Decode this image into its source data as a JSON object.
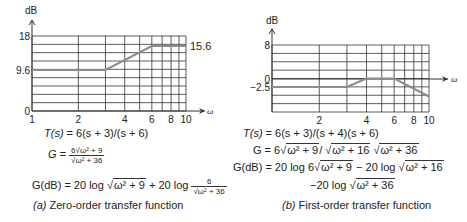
{
  "chart_data": [
    {
      "type": "line",
      "id": "a",
      "title": "(a) Zero-order transfer function",
      "xlabel": "ω",
      "ylabel": "dB",
      "xscale": "log",
      "xlim": [
        1,
        10
      ],
      "ylim": [
        0,
        18
      ],
      "xticks": [
        1,
        2,
        4,
        6,
        8,
        10
      ],
      "yticks": [
        0,
        9.6,
        18
      ],
      "grid": true,
      "x": [
        1,
        3,
        6,
        10
      ],
      "values": [
        9.6,
        9.6,
        15.6,
        15.6
      ],
      "annotations": [
        {
          "text": "15.6",
          "x": 10,
          "y": 15.6
        }
      ]
    },
    {
      "type": "line",
      "id": "b",
      "title": "(b) First-order transfer function",
      "xlabel": "ω",
      "ylabel": "dB",
      "xscale": "log",
      "xlim": [
        1,
        10
      ],
      "ylim": [
        -8,
        8
      ],
      "xticks": [
        2,
        4,
        6,
        8,
        10
      ],
      "yticks": [
        8,
        0,
        -2.5
      ],
      "grid": true,
      "x": [
        1,
        3,
        4,
        6,
        10
      ],
      "values": [
        -2.5,
        -2.5,
        0,
        0,
        -4.3
      ]
    }
  ],
  "panel_a": {
    "eq1": "T(s) = 6(s + 3)/(s + 6)",
    "eq2": "G = 6√(ω² + 9) / √(ω² + 36)",
    "eq3": "G(dB) = 20 log √(ω² + 9) + 20 log 6/√(ω² + 36)",
    "caption_tag": "(a)",
    "caption_text": "Zero-order transfer function",
    "parts": {
      "t_lhs": "T(s)",
      "t_rhs": " = 6(s + 3)/(s + 6)",
      "g_lhs": "G = ",
      "g_num": "6√ω² + 9",
      "g_den": "√ω² + 36",
      "gdb_a": "G(dB) = 20 log ",
      "gdb_s1": "ω² + 9",
      "gdb_b": " + 20 log ",
      "gdb_num": "6",
      "gdb_den": "√ω² + 36"
    }
  },
  "panel_b": {
    "eq1": "T(s) = 6(s + 3)/(s + 4)(s + 6)",
    "eq2": "G = 6√(ω² + 9) / √(ω² + 16) √(ω² + 36)",
    "eq3": "G(dB) = 20 log 6√(ω² + 9) − 20 log √(ω² + 16)",
    "eq4": "−20 log √(ω² + 36)",
    "caption_tag": "(b)",
    "caption_text": "First-order transfer function",
    "parts": {
      "t_lhs": "T(s)",
      "t_rhs": " = 6(s + 3)/(s + 4)(s + 6)",
      "g_a": "G = 6",
      "g_s1": "ω² + 9",
      "g_b": "/ ",
      "g_s2": "ω² + 16",
      "g_s3": "ω² + 36",
      "gdb_a": "G(dB) = 20 log 6",
      "gdb_s1": "ω² + 9",
      "gdb_b": " − 20 log ",
      "gdb_s2": "ω² + 16",
      "l4_a": "−20 log ",
      "l4_s": "ω² + 36"
    }
  },
  "colors": {
    "grid": "#333333",
    "curve": "#8c8c8c",
    "text": "#222222"
  }
}
